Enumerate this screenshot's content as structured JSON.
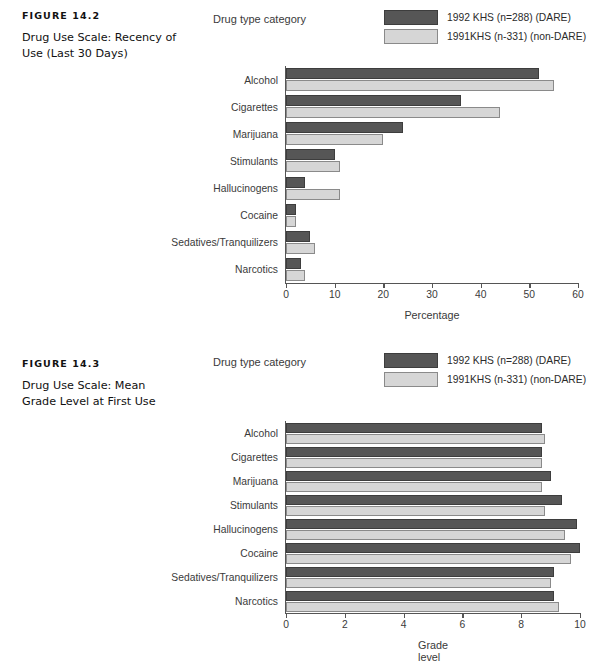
{
  "figures": [
    {
      "number": "FIGURE 14.2",
      "title": "Drug Use Scale: Recency of Use (Last 30 Days)",
      "axis_title_top": "Drug type category",
      "legend": [
        {
          "label": "1992 KHS (n=288) (DARE)",
          "swatch": "dark",
          "color": "#565656"
        },
        {
          "label": "1991KHS (n-331) (non-DARE)",
          "swatch": "light",
          "color": "#d6d6d6"
        }
      ],
      "chart_data": {
        "type": "bar",
        "orientation": "horizontal",
        "title": "Drug Use Scale: Recency of Use (Last 30 Days)",
        "xlabel": "Percentage",
        "ylabel": "Drug type category",
        "xlim": [
          0,
          60
        ],
        "xticks": [
          0,
          10,
          20,
          30,
          40,
          50,
          60
        ],
        "grid": false,
        "legend_position": "top-right",
        "categories": [
          "Alcohol",
          "Cigarettes",
          "Marijuana",
          "Stimulants",
          "Hallucinogens",
          "Cocaine",
          "Sedatives/Tranquilizers",
          "Narcotics"
        ],
        "series": [
          {
            "name": "1992 KHS (n=288) (DARE)",
            "color": "#565656",
            "values": [
              52,
              36,
              24,
              10,
              4,
              2,
              5,
              3
            ]
          },
          {
            "name": "1991KHS (n-331) (non-DARE)",
            "color": "#d6d6d6",
            "values": [
              55,
              44,
              20,
              11,
              11,
              2,
              6,
              4
            ]
          }
        ]
      }
    },
    {
      "number": "FIGURE 14.3",
      "title": "Drug Use Scale: Mean Grade Level at First Use",
      "axis_title_top": "Drug type category",
      "legend": [
        {
          "label": "1992 KHS (n=288) (DARE)",
          "swatch": "dark",
          "color": "#565656"
        },
        {
          "label": "1991KHS (n-331) (non-DARE)",
          "swatch": "light",
          "color": "#d6d6d6"
        }
      ],
      "chart_data": {
        "type": "bar",
        "orientation": "horizontal",
        "title": "Drug Use Scale: Mean Grade Level at First Use",
        "xlabel": "Grade level",
        "ylabel": "Drug type category",
        "xlim": [
          0,
          10
        ],
        "xticks": [
          0,
          2,
          4,
          6,
          8,
          10
        ],
        "grid": false,
        "legend_position": "top-right",
        "categories": [
          "Alcohol",
          "Cigarettes",
          "Marijuana",
          "Stimulants",
          "Hallucinogens",
          "Cocaine",
          "Sedatives/Tranquilizers",
          "Narcotics"
        ],
        "series": [
          {
            "name": "1992 KHS (n=288) (DARE)",
            "color": "#565656",
            "values": [
              8.7,
              8.7,
              9.0,
              9.4,
              9.9,
              10.0,
              9.1,
              9.1
            ]
          },
          {
            "name": "1991KHS (n-331) (non-DARE)",
            "color": "#d6d6d6",
            "values": [
              8.8,
              8.7,
              8.7,
              8.8,
              9.5,
              9.7,
              9.0,
              9.3
            ]
          }
        ]
      }
    }
  ]
}
